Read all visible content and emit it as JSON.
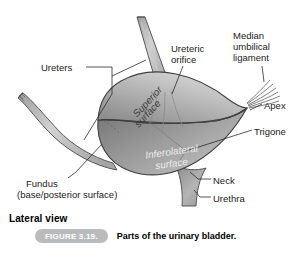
{
  "figure": {
    "view_label": "Lateral view",
    "badge": "FIGURE 3.19.",
    "caption": "Parts of the urinary bladder.",
    "badge_color": "#b9bbbd",
    "organ_color": "#a9a9a9",
    "leader_color": "#3b3b3b"
  },
  "labels": {
    "ureters": "Ureters",
    "ureteric_orifice": "Ureteric\norifice",
    "median_umbilical_ligament": "Median\numbilical\nligament",
    "apex": "Apex",
    "trigone": "Trigone",
    "neck": "Neck",
    "urethra": "Urethra",
    "fundus": "Fundus",
    "fundus_sub": "(base/posterior surface)"
  },
  "surfaces": {
    "superior": "Superior\nsurface",
    "inferolateral": "Inferolateral\nsurface"
  }
}
